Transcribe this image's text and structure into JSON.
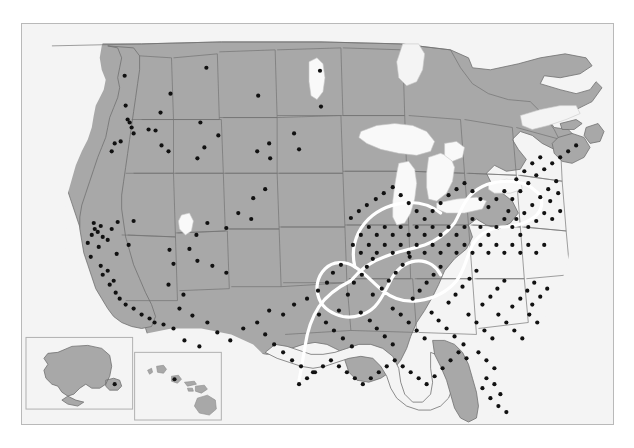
{
  "figure": {
    "type": "dot-distribution-map",
    "title": "",
    "caption": "",
    "region": "United States with Alaska and Hawaii insets",
    "projection": "albers-like",
    "marker_label": "study site",
    "marker_color": "#111111",
    "land_color": "#a8a8a8",
    "water_color": "#f7f7f7",
    "background_color": "#f4f4f4",
    "border_color": "#707070",
    "frame_color": "#b9b9b9",
    "contour_color": "#ffffff",
    "contour_label": "highlighted region outline"
  },
  "insets": [
    {
      "name": "alaska",
      "label": ""
    },
    {
      "name": "hawaii",
      "label": ""
    }
  ],
  "chart_data": {
    "type": "scatter",
    "title": "",
    "xlabel": "",
    "ylabel": "",
    "legend": [],
    "marker_count": 268,
    "points": [
      [
        103,
        52
      ],
      [
        185,
        44
      ],
      [
        299,
        47
      ],
      [
        149,
        70
      ],
      [
        179,
        99
      ],
      [
        237,
        72
      ],
      [
        300,
        83
      ],
      [
        139,
        89
      ],
      [
        104,
        82
      ],
      [
        106,
        96
      ],
      [
        108,
        99
      ],
      [
        110,
        104
      ],
      [
        112,
        110
      ],
      [
        93,
        120
      ],
      [
        90,
        128
      ],
      [
        99,
        118
      ],
      [
        127,
        106
      ],
      [
        134,
        107
      ],
      [
        140,
        122
      ],
      [
        147,
        128
      ],
      [
        176,
        135
      ],
      [
        183,
        124
      ],
      [
        197,
        112
      ],
      [
        236,
        128
      ],
      [
        248,
        120
      ],
      [
        249,
        135
      ],
      [
        273,
        110
      ],
      [
        278,
        126
      ],
      [
        244,
        166
      ],
      [
        232,
        175
      ],
      [
        217,
        190
      ],
      [
        230,
        196
      ],
      [
        205,
        205
      ],
      [
        186,
        200
      ],
      [
        175,
        212
      ],
      [
        168,
        226
      ],
      [
        176,
        238
      ],
      [
        191,
        243
      ],
      [
        205,
        250
      ],
      [
        72,
        200
      ],
      [
        73,
        206
      ],
      [
        70,
        212
      ],
      [
        76,
        209
      ],
      [
        79,
        203
      ],
      [
        81,
        214
      ],
      [
        66,
        220
      ],
      [
        77,
        224
      ],
      [
        86,
        217
      ],
      [
        90,
        206
      ],
      [
        96,
        199
      ],
      [
        69,
        234
      ],
      [
        95,
        231
      ],
      [
        112,
        198
      ],
      [
        107,
        222
      ],
      [
        81,
        252
      ],
      [
        88,
        262
      ],
      [
        94,
        270
      ],
      [
        98,
        276
      ],
      [
        104,
        282
      ],
      [
        112,
        286
      ],
      [
        120,
        292
      ],
      [
        128,
        296
      ],
      [
        133,
        300
      ],
      [
        142,
        302
      ],
      [
        92,
        258
      ],
      [
        86,
        248
      ],
      [
        79,
        243
      ],
      [
        148,
        227
      ],
      [
        152,
        241
      ],
      [
        147,
        262
      ],
      [
        162,
        272
      ],
      [
        158,
        286
      ],
      [
        171,
        293
      ],
      [
        186,
        300
      ],
      [
        196,
        310
      ],
      [
        152,
        306
      ],
      [
        163,
        318
      ],
      [
        178,
        324
      ],
      [
        209,
        318
      ],
      [
        222,
        306
      ],
      [
        236,
        300
      ],
      [
        244,
        312
      ],
      [
        253,
        322
      ],
      [
        262,
        330
      ],
      [
        271,
        338
      ],
      [
        280,
        344
      ],
      [
        292,
        350
      ],
      [
        248,
        288
      ],
      [
        262,
        292
      ],
      [
        273,
        282
      ],
      [
        286,
        276
      ],
      [
        297,
        268
      ],
      [
        306,
        260
      ],
      [
        312,
        250
      ],
      [
        320,
        242
      ],
      [
        298,
        292
      ],
      [
        305,
        300
      ],
      [
        313,
        308
      ],
      [
        322,
        316
      ],
      [
        331,
        324
      ],
      [
        318,
        288
      ],
      [
        327,
        272
      ],
      [
        333,
        260
      ],
      [
        341,
        252
      ],
      [
        346,
        244
      ],
      [
        352,
        236
      ],
      [
        340,
        290
      ],
      [
        349,
        298
      ],
      [
        356,
        306
      ],
      [
        364,
        314
      ],
      [
        372,
        322
      ],
      [
        352,
        272
      ],
      [
        361,
        266
      ],
      [
        368,
        258
      ],
      [
        375,
        250
      ],
      [
        382,
        242
      ],
      [
        389,
        234
      ],
      [
        372,
        286
      ],
      [
        380,
        292
      ],
      [
        388,
        300
      ],
      [
        396,
        308
      ],
      [
        404,
        316
      ],
      [
        392,
        276
      ],
      [
        399,
        268
      ],
      [
        406,
        260
      ],
      [
        413,
        252
      ],
      [
        420,
        244
      ],
      [
        411,
        290
      ],
      [
        418,
        298
      ],
      [
        426,
        306
      ],
      [
        434,
        314
      ],
      [
        443,
        322
      ],
      [
        428,
        280
      ],
      [
        435,
        272
      ],
      [
        442,
        264
      ],
      [
        449,
        256
      ],
      [
        456,
        248
      ],
      [
        448,
        292
      ],
      [
        456,
        300
      ],
      [
        464,
        308
      ],
      [
        472,
        316
      ],
      [
        462,
        282
      ],
      [
        470,
        274
      ],
      [
        477,
        266
      ],
      [
        484,
        258
      ],
      [
        478,
        292
      ],
      [
        486,
        300
      ],
      [
        494,
        308
      ],
      [
        502,
        316
      ],
      [
        492,
        284
      ],
      [
        500,
        276
      ],
      [
        507,
        268
      ],
      [
        514,
        260
      ],
      [
        509,
        292
      ],
      [
        517,
        300
      ],
      [
        512,
        282
      ],
      [
        520,
        274
      ],
      [
        527,
        266
      ],
      [
        330,
        195
      ],
      [
        338,
        188
      ],
      [
        346,
        182
      ],
      [
        355,
        176
      ],
      [
        363,
        170
      ],
      [
        372,
        164
      ],
      [
        380,
        172
      ],
      [
        388,
        180
      ],
      [
        396,
        188
      ],
      [
        404,
        196
      ],
      [
        412,
        188
      ],
      [
        420,
        180
      ],
      [
        428,
        172
      ],
      [
        436,
        166
      ],
      [
        444,
        160
      ],
      [
        452,
        168
      ],
      [
        460,
        176
      ],
      [
        468,
        184
      ],
      [
        476,
        176
      ],
      [
        484,
        168
      ],
      [
        492,
        176
      ],
      [
        500,
        168
      ],
      [
        508,
        160
      ],
      [
        516,
        152
      ],
      [
        524,
        146
      ],
      [
        532,
        140
      ],
      [
        540,
        134
      ],
      [
        548,
        128
      ],
      [
        556,
        122
      ],
      [
        520,
        134
      ],
      [
        512,
        140
      ],
      [
        504,
        148
      ],
      [
        496,
        156
      ],
      [
        488,
        188
      ],
      [
        496,
        196
      ],
      [
        504,
        190
      ],
      [
        512,
        182
      ],
      [
        520,
        174
      ],
      [
        528,
        166
      ],
      [
        536,
        158
      ],
      [
        530,
        178
      ],
      [
        538,
        170
      ],
      [
        524,
        190
      ],
      [
        532,
        196
      ],
      [
        540,
        188
      ],
      [
        516,
        198
      ],
      [
        508,
        204
      ],
      [
        500,
        212
      ],
      [
        492,
        204
      ],
      [
        484,
        196
      ],
      [
        476,
        204
      ],
      [
        468,
        212
      ],
      [
        460,
        204
      ],
      [
        452,
        196
      ],
      [
        444,
        204
      ],
      [
        436,
        212
      ],
      [
        428,
        204
      ],
      [
        420,
        212
      ],
      [
        412,
        204
      ],
      [
        404,
        212
      ],
      [
        396,
        204
      ],
      [
        388,
        212
      ],
      [
        380,
        204
      ],
      [
        372,
        212
      ],
      [
        364,
        204
      ],
      [
        356,
        212
      ],
      [
        348,
        204
      ],
      [
        340,
        212
      ],
      [
        332,
        222
      ],
      [
        340,
        230
      ],
      [
        348,
        222
      ],
      [
        356,
        230
      ],
      [
        364,
        222
      ],
      [
        372,
        230
      ],
      [
        380,
        222
      ],
      [
        388,
        230
      ],
      [
        396,
        222
      ],
      [
        404,
        230
      ],
      [
        412,
        222
      ],
      [
        420,
        230
      ],
      [
        428,
        222
      ],
      [
        436,
        230
      ],
      [
        444,
        222
      ],
      [
        452,
        230
      ],
      [
        460,
        222
      ],
      [
        468,
        230
      ],
      [
        476,
        222
      ],
      [
        484,
        230
      ],
      [
        492,
        222
      ],
      [
        500,
        230
      ],
      [
        508,
        222
      ],
      [
        516,
        230
      ],
      [
        524,
        222
      ],
      [
        458,
        330
      ],
      [
        466,
        338
      ],
      [
        474,
        346
      ],
      [
        466,
        356
      ],
      [
        462,
        366
      ],
      [
        470,
        376
      ],
      [
        478,
        384
      ],
      [
        486,
        390
      ],
      [
        480,
        372
      ],
      [
        474,
        362
      ],
      [
        446,
        336
      ],
      [
        438,
        330
      ],
      [
        430,
        338
      ],
      [
        422,
        346
      ],
      [
        414,
        354
      ],
      [
        406,
        362
      ],
      [
        398,
        356
      ],
      [
        390,
        350
      ],
      [
        382,
        344
      ],
      [
        374,
        338
      ],
      [
        366,
        344
      ],
      [
        358,
        350
      ],
      [
        350,
        356
      ],
      [
        342,
        362
      ],
      [
        334,
        356
      ],
      [
        326,
        350
      ],
      [
        318,
        344
      ],
      [
        310,
        338
      ],
      [
        302,
        344
      ],
      [
        294,
        350
      ],
      [
        286,
        356
      ],
      [
        278,
        362
      ]
    ],
    "alaska_points": [
      [
        112,
        390
      ]
    ],
    "hawaii_points": [
      [
        166,
        374
      ]
    ]
  }
}
